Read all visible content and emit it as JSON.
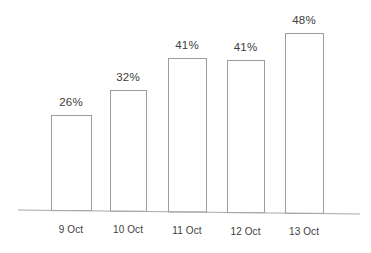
{
  "chart_data": {
    "type": "bar",
    "title": "",
    "subtitle": "",
    "xlabel": "",
    "ylabel": "",
    "categories": [
      "9 Oct",
      "10 Oct",
      "11 Oct",
      "12 Oct",
      "13 Oct"
    ],
    "values": [
      26,
      32,
      41,
      41,
      48
    ],
    "data_labels": [
      "26%",
      "32%",
      "41%",
      "41%",
      "48%"
    ],
    "ylim": [
      0,
      55
    ],
    "grid": false,
    "legend": null,
    "legend_position": "none",
    "annotations": [],
    "style": {
      "bar_fill": "#ffffff",
      "bar_stroke": "#9d9d9d",
      "axis_color": "#a8a8a8",
      "text_color": "#3d3d3d",
      "background": "#ffffff"
    }
  },
  "geometry": {
    "baseline_y_left": 210,
    "baseline_y_right": 214,
    "baseline_x_start": 18,
    "baseline_x_end": 360,
    "bars": [
      {
        "x": 51,
        "width": 40,
        "top": 115
      },
      {
        "x": 110,
        "width": 36,
        "top": 90
      },
      {
        "x": 168,
        "width": 38,
        "top": 58
      },
      {
        "x": 227,
        "width": 37,
        "top": 60
      },
      {
        "x": 285,
        "width": 38,
        "top": 33
      }
    ]
  }
}
